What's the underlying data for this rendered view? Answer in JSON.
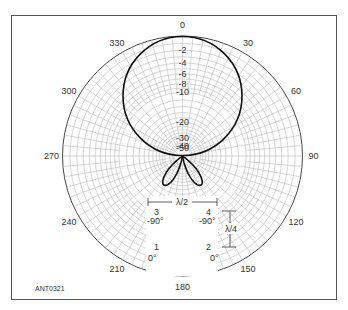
{
  "figure": {
    "id_label": "ANT0321"
  },
  "polar": {
    "angle_labels": [
      "0",
      "30",
      "60",
      "90",
      "120",
      "150",
      "180",
      "210",
      "240",
      "270",
      "300",
      "330"
    ],
    "angle_values_deg": [
      0,
      30,
      60,
      90,
      120,
      150,
      180,
      210,
      240,
      270,
      300,
      330
    ],
    "radial_labels": [
      "-2",
      "-4",
      "-6",
      "-8",
      "-10",
      "-20",
      "-30",
      "-40",
      "-50"
    ],
    "radial_values_db": [
      -2,
      -4,
      -6,
      -8,
      -10,
      -20,
      -30,
      -40,
      -50
    ],
    "outer_label": "0"
  },
  "array": {
    "spacing_horizontal": "λ/2",
    "spacing_vertical": "λ/4",
    "elements": [
      {
        "number": "1",
        "phase": "0°"
      },
      {
        "number": "2",
        "phase": "0°"
      },
      {
        "number": "3",
        "phase": "-90°"
      },
      {
        "number": "4",
        "phase": "-90°"
      }
    ]
  },
  "chart_data": {
    "type": "polar",
    "title": "",
    "angle_unit": "degrees",
    "radial_unit": "dB",
    "radial_range": [
      -50,
      0
    ],
    "angle_ticks": [
      0,
      30,
      60,
      90,
      120,
      150,
      180,
      210,
      240,
      270,
      300,
      330
    ],
    "radial_ticks": [
      0,
      -2,
      -4,
      -6,
      -8,
      -10,
      -20,
      -30,
      -40,
      -50
    ],
    "series": [
      {
        "name": "main lobe",
        "peak_angle_deg": 0,
        "peak_db": 0,
        "null_angle_deg": 90
      },
      {
        "name": "rear lobe left",
        "peak_angle_deg": 210,
        "peak_db": -20
      },
      {
        "name": "rear lobe right",
        "peak_angle_deg": 150,
        "peak_db": -20
      }
    ]
  }
}
